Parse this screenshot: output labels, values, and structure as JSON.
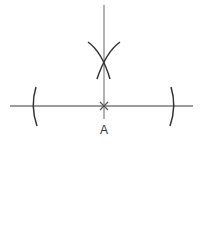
{
  "diagram": {
    "point_label": "A",
    "colors": {
      "line": "#7a7a7a",
      "arc": "#333333",
      "label": "#333333"
    }
  }
}
